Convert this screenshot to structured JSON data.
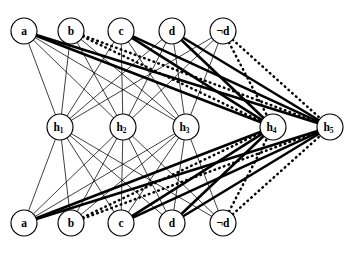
{
  "diagram": {
    "type": "layered-graph",
    "background_color": "#ffffff",
    "stroke_color": "#000000",
    "node_radius": 13,
    "layers": [
      {
        "name": "top-input-layer",
        "y": 31,
        "nodes": [
          {
            "id": "t_a",
            "label": "a",
            "sub": "",
            "x": 24
          },
          {
            "id": "t_b",
            "label": "b",
            "sub": "",
            "x": 71
          },
          {
            "id": "t_c",
            "label": "c",
            "sub": "",
            "x": 121
          },
          {
            "id": "t_d",
            "label": "d",
            "sub": "",
            "x": 172
          },
          {
            "id": "t_nd",
            "label": "¬d",
            "sub": "",
            "x": 223
          }
        ]
      },
      {
        "name": "hidden-layer",
        "y": 127,
        "nodes": [
          {
            "id": "h1",
            "label": "h",
            "sub": "1",
            "x": 60
          },
          {
            "id": "h2",
            "label": "h",
            "sub": "2",
            "x": 123
          },
          {
            "id": "h3",
            "label": "h",
            "sub": "3",
            "x": 186
          },
          {
            "id": "h4",
            "label": "h",
            "sub": "4",
            "x": 273
          },
          {
            "id": "h5",
            "label": "h",
            "sub": "5",
            "x": 330
          }
        ]
      },
      {
        "name": "bottom-input-layer",
        "y": 223,
        "nodes": [
          {
            "id": "b_a",
            "label": "a",
            "sub": "",
            "x": 24
          },
          {
            "id": "b_b",
            "label": "b",
            "sub": "",
            "x": 71
          },
          {
            "id": "b_c",
            "label": "c",
            "sub": "",
            "x": 121
          },
          {
            "id": "b_d",
            "label": "d",
            "sub": "",
            "x": 172
          },
          {
            "id": "b_nd",
            "label": "¬d",
            "sub": "",
            "x": 223
          }
        ]
      }
    ],
    "edge_styles": {
      "thin": {
        "width": 0.75,
        "dash": "none"
      },
      "thick": {
        "width": 2.6,
        "dash": "none"
      },
      "dotted": {
        "width": 2.5,
        "dash": "0.6 4.4"
      }
    },
    "edges": [
      {
        "from": "t_a",
        "to": "h1",
        "style": "thin"
      },
      {
        "from": "t_a",
        "to": "h2",
        "style": "thin"
      },
      {
        "from": "t_a",
        "to": "h3",
        "style": "thin"
      },
      {
        "from": "t_a",
        "to": "h4",
        "style": "thick"
      },
      {
        "from": "t_a",
        "to": "h5",
        "style": "thick"
      },
      {
        "from": "t_b",
        "to": "h1",
        "style": "thin"
      },
      {
        "from": "t_b",
        "to": "h2",
        "style": "thin"
      },
      {
        "from": "t_b",
        "to": "h3",
        "style": "thin"
      },
      {
        "from": "t_b",
        "to": "h4",
        "style": "dotted"
      },
      {
        "from": "t_b",
        "to": "h5",
        "style": "dotted"
      },
      {
        "from": "t_c",
        "to": "h1",
        "style": "thin"
      },
      {
        "from": "t_c",
        "to": "h2",
        "style": "thin"
      },
      {
        "from": "t_c",
        "to": "h3",
        "style": "thin"
      },
      {
        "from": "t_c",
        "to": "h4",
        "style": "thick"
      },
      {
        "from": "t_c",
        "to": "h5",
        "style": "thick"
      },
      {
        "from": "t_d",
        "to": "h1",
        "style": "thin"
      },
      {
        "from": "t_d",
        "to": "h2",
        "style": "thin"
      },
      {
        "from": "t_d",
        "to": "h3",
        "style": "thin"
      },
      {
        "from": "t_d",
        "to": "h4",
        "style": "thick"
      },
      {
        "from": "t_d",
        "to": "h5",
        "style": "thick"
      },
      {
        "from": "t_nd",
        "to": "h1",
        "style": "thin"
      },
      {
        "from": "t_nd",
        "to": "h2",
        "style": "thin"
      },
      {
        "from": "t_nd",
        "to": "h3",
        "style": "thin"
      },
      {
        "from": "t_nd",
        "to": "h4",
        "style": "dotted"
      },
      {
        "from": "t_nd",
        "to": "h5",
        "style": "dotted"
      },
      {
        "from": "b_a",
        "to": "h1",
        "style": "thin"
      },
      {
        "from": "b_a",
        "to": "h2",
        "style": "thin"
      },
      {
        "from": "b_a",
        "to": "h3",
        "style": "thin"
      },
      {
        "from": "b_a",
        "to": "h4",
        "style": "thick"
      },
      {
        "from": "b_a",
        "to": "h5",
        "style": "thick"
      },
      {
        "from": "b_b",
        "to": "h1",
        "style": "thin"
      },
      {
        "from": "b_b",
        "to": "h2",
        "style": "thin"
      },
      {
        "from": "b_b",
        "to": "h3",
        "style": "thin"
      },
      {
        "from": "b_b",
        "to": "h4",
        "style": "dotted"
      },
      {
        "from": "b_b",
        "to": "h5",
        "style": "dotted"
      },
      {
        "from": "b_c",
        "to": "h1",
        "style": "thin"
      },
      {
        "from": "b_c",
        "to": "h2",
        "style": "thin"
      },
      {
        "from": "b_c",
        "to": "h3",
        "style": "thin"
      },
      {
        "from": "b_c",
        "to": "h4",
        "style": "thick"
      },
      {
        "from": "b_c",
        "to": "h5",
        "style": "thick"
      },
      {
        "from": "b_d",
        "to": "h1",
        "style": "thin"
      },
      {
        "from": "b_d",
        "to": "h2",
        "style": "thin"
      },
      {
        "from": "b_d",
        "to": "h3",
        "style": "thin"
      },
      {
        "from": "b_d",
        "to": "h4",
        "style": "thick"
      },
      {
        "from": "b_d",
        "to": "h5",
        "style": "thick"
      },
      {
        "from": "b_nd",
        "to": "h1",
        "style": "thin"
      },
      {
        "from": "b_nd",
        "to": "h2",
        "style": "thin"
      },
      {
        "from": "b_nd",
        "to": "h3",
        "style": "thin"
      },
      {
        "from": "b_nd",
        "to": "h4",
        "style": "dotted"
      },
      {
        "from": "b_nd",
        "to": "h5",
        "style": "dotted"
      }
    ]
  }
}
